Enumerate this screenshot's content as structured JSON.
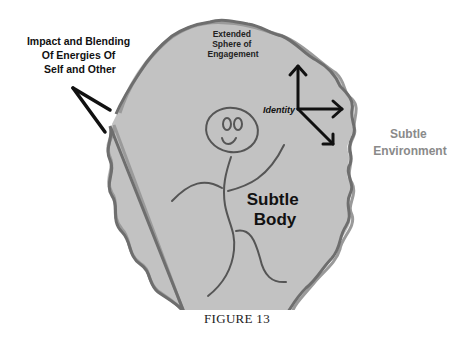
{
  "figure": {
    "caption": "FIGURE 13",
    "colors": {
      "background": "#ffffff",
      "sphere_fill": "#c2c2c2",
      "sphere_outline": "#6e6e6e",
      "sphere_outline_light": "#8c8c8c",
      "stroke_dark": "#111111",
      "figure_stroke": "#555555",
      "environment_text": "#8a8a8a"
    },
    "labels": {
      "impact": [
        "Impact and Blending",
        "Of Energies Of",
        "Self and Other"
      ],
      "extended_sphere": [
        "Extended",
        "Sphere of",
        "Engagement"
      ],
      "identity": "Identity",
      "subtle_environment": [
        "Subtle",
        "Environment"
      ],
      "subtle_body": [
        "Subtle",
        "Body"
      ]
    },
    "icons": {
      "impact_marker": "chevron-angle-icon",
      "identity_axes": "three-arrow-axes-icon",
      "stick_figure": "stick-figure-icon"
    }
  }
}
